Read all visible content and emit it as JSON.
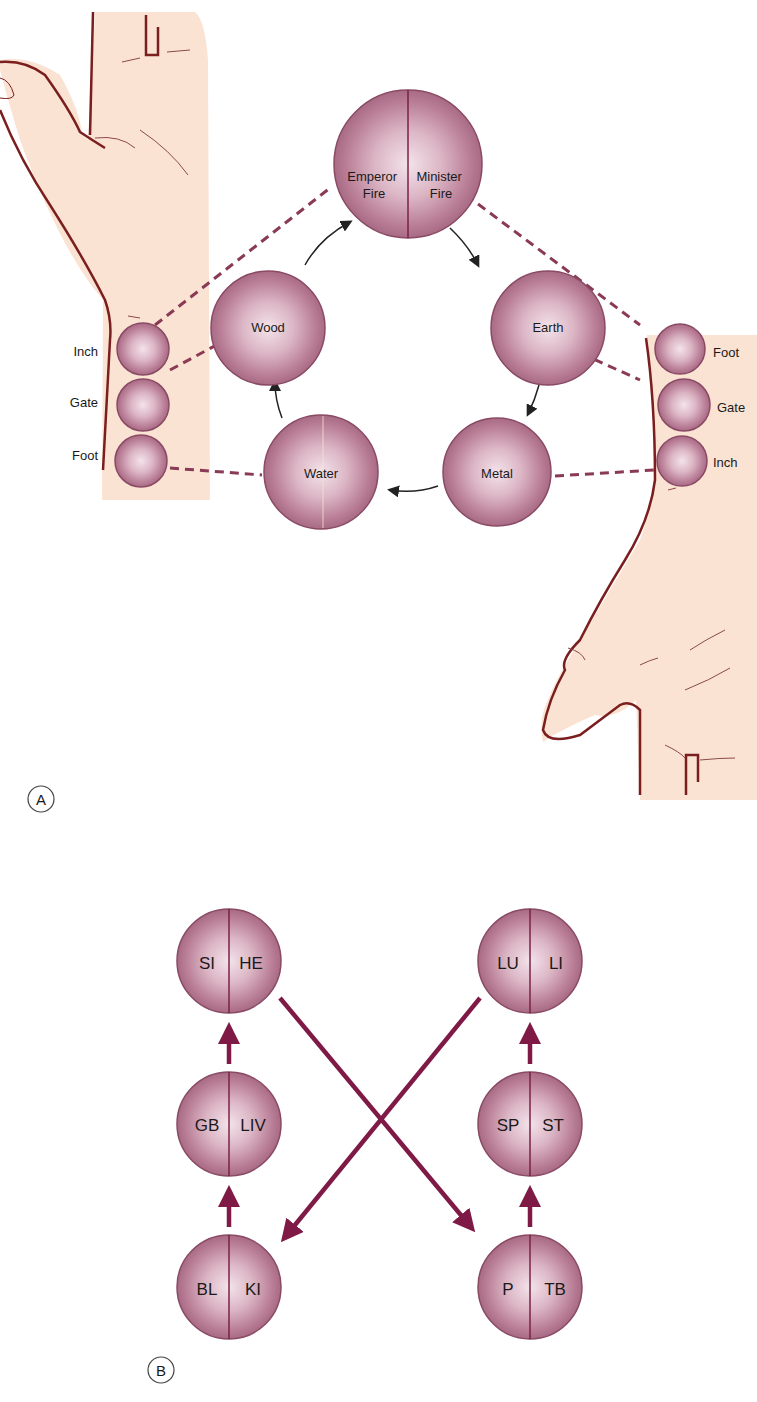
{
  "colors": {
    "skin": "#fbe3d4",
    "skin_outline": "#7a1e1e",
    "circle_edge": "#8a4a64",
    "circle_mid": "#c48aa0",
    "circle_dark": "#a86a84",
    "circle_light": "#f1dfe6",
    "divider": "#7a2244",
    "dashed": "#8a3a55",
    "arrow_thin": "#222222",
    "arrow_thick": "#7e1a45",
    "text": "#1a1a1a"
  },
  "panel_a": {
    "label": "A",
    "fire": {
      "left": "Emperor\nFire",
      "right": "Minister\nFire",
      "left_l1": "Emperor",
      "left_l2": "Fire",
      "right_l1": "Minister",
      "right_l2": "Fire"
    },
    "elements": {
      "wood": "Wood",
      "earth": "Earth",
      "metal": "Metal",
      "water": "Water"
    },
    "left_wrist_positions": [
      "Inch",
      "Gate",
      "Foot"
    ],
    "right_wrist_positions": [
      "Foot",
      "Gate",
      "Inch"
    ]
  },
  "panel_b": {
    "label": "B",
    "left_column": [
      {
        "left": "SI",
        "right": "HE"
      },
      {
        "left": "GB",
        "right": "LIV"
      },
      {
        "left": "BL",
        "right": "KI"
      }
    ],
    "right_column": [
      {
        "left": "LU",
        "right": "LI"
      },
      {
        "left": "SP",
        "right": "ST"
      },
      {
        "left": "P",
        "right": "TB"
      }
    ]
  }
}
